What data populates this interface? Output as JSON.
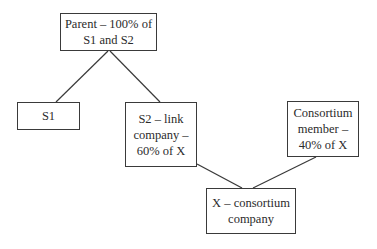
{
  "diagram": {
    "nodes": [
      {
        "id": "parent",
        "label": "Parent – 100% of\nS1 and S2"
      },
      {
        "id": "s1",
        "label": "S1"
      },
      {
        "id": "s2",
        "label": "S2 – link\ncompany –\n60% of X"
      },
      {
        "id": "consortium_member",
        "label": "Consortium\nmember –\n40% of X"
      },
      {
        "id": "x",
        "label": "X – consortium\ncompany"
      }
    ],
    "edges": [
      {
        "from": "parent",
        "to": "s1"
      },
      {
        "from": "parent",
        "to": "s2"
      },
      {
        "from": "s2",
        "to": "x"
      },
      {
        "from": "consortium_member",
        "to": "x"
      }
    ],
    "colors": {
      "line": "#3a3a3a",
      "text": "#2b2b2b",
      "background": "#ffffff"
    }
  }
}
